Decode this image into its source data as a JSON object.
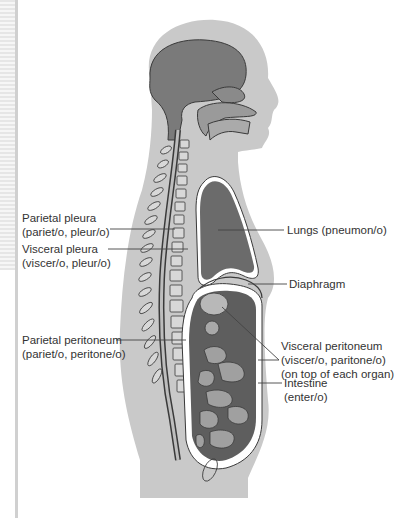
{
  "diagram": {
    "type": "anatomical-sagittal-section",
    "colors": {
      "body_silhouette": "#c9c9c9",
      "organ_fill": "#6b6b6b",
      "membrane": "#ffffff",
      "outline": "#3a3a3a",
      "label_text": "#333333",
      "leader_line": "#444444"
    },
    "labels": {
      "parietal_pleura": {
        "line1": "Parietal pleura",
        "line2": "(pariet/o, pleur/o)"
      },
      "visceral_pleura": {
        "line1": "Visceral pleura",
        "line2": "(viscer/o, pleur/o)"
      },
      "lungs": {
        "line1": "Lungs (pneumon/o)"
      },
      "diaphragm": {
        "line1": "Diaphragm"
      },
      "parietal_peritoneum": {
        "line1": "Parietal peritoneum",
        "line2": "(pariet/o, peritone/o)"
      },
      "visceral_peritoneum": {
        "line1": "Visceral peritoneum",
        "line2": "(viscer/o, paritone/o)",
        "line3": "(on top of each organ)"
      },
      "intestine": {
        "line1": "Intestine",
        "line2": "(enter/o)"
      }
    }
  }
}
